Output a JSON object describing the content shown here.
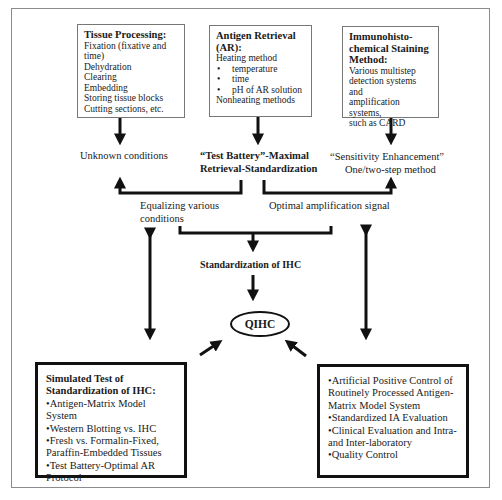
{
  "diagram": {
    "top_boxes": [
      {
        "title": "Tissue Processing:",
        "lines": [
          "Fixation (fixative and",
          "time)",
          "Dehydration",
          "Clearing",
          "Embedding",
          "Storing tissue blocks",
          "Cutting sections, etc."
        ]
      },
      {
        "title": "Antigen Retrieval (AR):",
        "intro": "Heating method",
        "bullets": [
          "temperature",
          "time",
          "pH of AR solution"
        ],
        "outro": "Nonheating methods"
      },
      {
        "title": "Immunohisto-chemical Staining Method:",
        "lines": [
          "Various multistep",
          "detection systems and",
          "amplification systems,",
          "such as CARD"
        ]
      }
    ],
    "middle_labels": {
      "unknown_conditions": "Unknown conditions",
      "test_battery_line1": "“Test Battery”-Maximal",
      "test_battery_line2": "Retrieval-Standardization",
      "sensitivity_line1": "“Sensitivity Enhancement”",
      "sensitivity_line2": "One/two-step method",
      "equalizing_line1": "Equalizing various",
      "equalizing_line2": "conditions",
      "optimal_amplification": "Optimal amplification signal",
      "standardization": "Standardization of IHC",
      "qihc": "QIHC"
    },
    "bottom_left_box": {
      "title_line1": "Simulated Test of",
      "title_line2": "Standardization of IHC:",
      "items": [
        "Antigen-Matrix Model System",
        "Western Blotting vs. IHC",
        "Fresh vs. Formalin-Fixed,",
        "Paraffin-Embedded Tissues",
        "Test Battery-Optimal AR",
        "Protocol"
      ],
      "bulleted": [
        true,
        true,
        true,
        false,
        true,
        false
      ]
    },
    "bottom_right_box": {
      "items": [
        "Artificial Positive Control of",
        "Routinely Processed Antigen-",
        "Matrix Model System",
        "Standardized IA Evaluation",
        "Clinical Evaluation and Intra-",
        "and Inter-laboratory",
        "Quality Control"
      ],
      "bulleted": [
        true,
        false,
        false,
        true,
        true,
        false,
        true
      ]
    },
    "colors": {
      "line": "#111111",
      "box_border": "#777777",
      "frame_border": "#8c8c8c",
      "background": "#ffffff"
    }
  }
}
